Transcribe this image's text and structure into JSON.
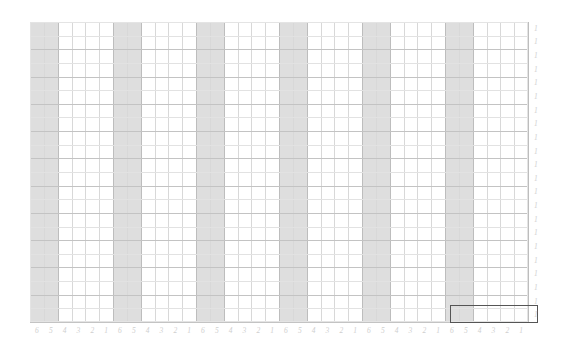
{
  "figure": {
    "title": "",
    "background_color": "#ffffff",
    "plot": {
      "left": 30,
      "top": 22,
      "width": 498,
      "height": 300,
      "border_color": "#e4e4e4"
    }
  },
  "chart_data": {
    "type": "heatmap",
    "title": "",
    "subtitle": "",
    "xlabel": "",
    "ylabel": "",
    "grid": true,
    "legend": null,
    "x_axis": {
      "position": "bottom",
      "n_groups": 6,
      "group_size": 6,
      "group_tick_labels": [
        "6",
        "5",
        "4",
        "3",
        "2",
        "1"
      ],
      "tick_labels": [
        "6",
        "5",
        "4",
        "3",
        "2",
        "1",
        "6",
        "5",
        "4",
        "3",
        "2",
        "1",
        "6",
        "5",
        "4",
        "3",
        "2",
        "1",
        "6",
        "5",
        "4",
        "3",
        "2",
        "1",
        "6",
        "5",
        "4",
        "3",
        "2",
        "1",
        "6",
        "5",
        "4",
        "3",
        "2",
        "1"
      ]
    },
    "y_axis": {
      "position": "right",
      "tick_labels": [
        "1",
        "1",
        "1",
        "1",
        "1",
        "1",
        "1",
        "1",
        "1",
        "1",
        "1",
        "1",
        "1",
        "1",
        "1",
        "1",
        "1",
        "1",
        "1",
        "1",
        "1",
        "1"
      ]
    },
    "shaded_bands": {
      "color": "#dedede",
      "description": "first two columns of each six-column group are shaded",
      "columns_per_group_shaded": 2,
      "group_indices": [
        0,
        1,
        2,
        3,
        4,
        5
      ]
    },
    "gridlines": {
      "minor_color": "#e2e2e2",
      "major_color": "#c3c3c3",
      "n_vertical": 37,
      "n_horizontal": 23
    },
    "selection": {
      "label": "",
      "border_color": "#555555",
      "x": 450,
      "y": 305,
      "width": 88,
      "height": 18,
      "covers_groups": [
        "6"
      ],
      "covers_rows": [
        "1"
      ]
    }
  },
  "colors": {
    "band": "#dedede",
    "grid_minor": "#e2e2e2",
    "grid_major": "#c3c3c3",
    "tick_text": "#cfcfcf",
    "selection_border": "#555555",
    "background": "#ffffff"
  }
}
